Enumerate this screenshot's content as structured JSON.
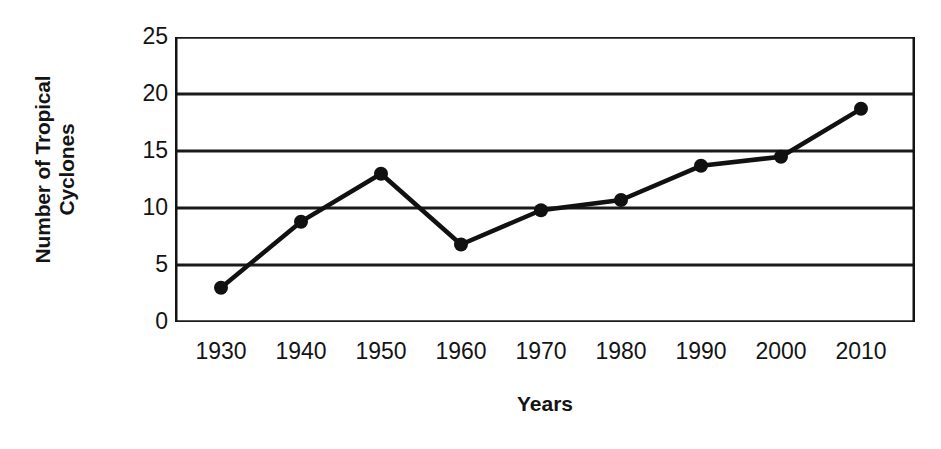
{
  "chart_data": {
    "type": "line",
    "title": "",
    "xlabel": "Years",
    "ylabel_line1": "Number of Tropical",
    "ylabel_line2": "Cyclones",
    "ylabel": "Number of Tropical Cyclones",
    "x": [
      1930,
      1940,
      1950,
      1960,
      1970,
      1980,
      1990,
      2000,
      2010
    ],
    "categories": [
      "1930",
      "1940",
      "1950",
      "1960",
      "1970",
      "1980",
      "1990",
      "2000",
      "2010"
    ],
    "values": [
      3.0,
      8.8,
      13.0,
      6.8,
      9.8,
      10.7,
      13.7,
      14.5,
      18.7
    ],
    "series": [
      {
        "name": "Number of Tropical Cyclones",
        "values": [
          3.0,
          8.8,
          13.0,
          6.8,
          9.8,
          10.7,
          13.7,
          14.5,
          18.7
        ]
      }
    ],
    "xlim": [
      1925,
      2015
    ],
    "ylim": [
      0,
      25
    ],
    "yticks": [
      0,
      5,
      10,
      15,
      20,
      25
    ],
    "ytick_labels": [
      "0",
      "5",
      "10",
      "15",
      "20",
      "25"
    ],
    "xticks": [
      1930,
      1940,
      1950,
      1960,
      1970,
      1980,
      1990,
      2000,
      2010
    ],
    "grid": "horizontal",
    "grid_color": "#1a1a1a",
    "legend": "none",
    "line_color": "#111111",
    "marker": "filled-circle",
    "marker_color": "#111111",
    "background": "#ffffff"
  }
}
